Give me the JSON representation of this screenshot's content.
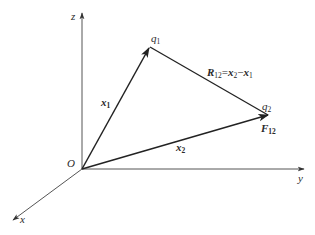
{
  "diagram": {
    "colors": {
      "axis": "#555555",
      "vector": "#2a2a2a",
      "text": "#2a2a2a",
      "background": "#ffffff"
    },
    "origin": {
      "label": "O",
      "x": 82,
      "y": 169
    },
    "axes": [
      {
        "name": "z",
        "label": "z",
        "from": [
          82,
          169
        ],
        "to": [
          82,
          12
        ]
      },
      {
        "name": "y",
        "label": "y",
        "from": [
          82,
          169
        ],
        "to": [
          305,
          169
        ]
      },
      {
        "name": "x",
        "label": "x",
        "from": [
          82,
          169
        ],
        "to": [
          12,
          221
        ]
      }
    ],
    "points": {
      "q1": {
        "label": "q",
        "sub": "1",
        "x": 150,
        "y": 47
      },
      "q2": {
        "label": "q",
        "sub": "2",
        "x": 269,
        "y": 115
      }
    },
    "vectors": {
      "x1": {
        "label": "x",
        "sub": "1",
        "from": "O",
        "to": "q1"
      },
      "x2": {
        "label": "x",
        "sub": "2",
        "from": "O",
        "to": "q2"
      },
      "R12": {
        "label": "R",
        "sub": "12",
        "eq": "=",
        "rhs_a": "x",
        "rhs_a_sub": "2",
        "minus": "−",
        "rhs_b": "x",
        "rhs_b_sub": "1",
        "from": "q1",
        "to": "q2"
      }
    },
    "force": {
      "label": "F",
      "sub": "12"
    }
  }
}
